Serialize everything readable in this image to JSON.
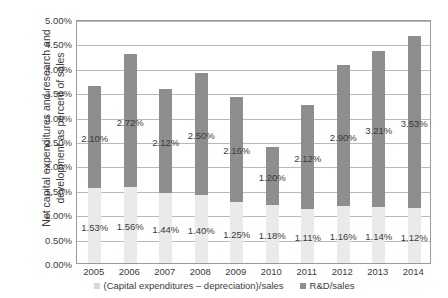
{
  "chart_data": {
    "type": "bar",
    "subtype": "stacked-bar",
    "title": "",
    "xlabel": "",
    "ylabel": "Net capital expenditures and research and development as percent of sales",
    "ylabel_line1": "Net capital expenditures and research and",
    "ylabel_line2": "development as percent of sales",
    "categories": [
      "2005",
      "2006",
      "2007",
      "2008",
      "2009",
      "2010",
      "2011",
      "2012",
      "2013",
      "2014"
    ],
    "ylim": [
      0,
      5
    ],
    "yticks": [
      "0.00%",
      "0.50%",
      "1.00%",
      "1.50%",
      "2.00%",
      "2.50%",
      "3.00%",
      "3.50%",
      "4.00%",
      "4.50%",
      "5.00%"
    ],
    "ytick_values": [
      0,
      0.5,
      1.0,
      1.5,
      2.0,
      2.5,
      3.0,
      3.5,
      4.0,
      4.5,
      5.0
    ],
    "grid": true,
    "legend_position": "bottom",
    "series": [
      {
        "name": "(Capital expenditures – depreciation)/sales",
        "color": "#eaeaea",
        "values": [
          1.53,
          1.56,
          1.44,
          1.4,
          1.25,
          1.18,
          1.11,
          1.16,
          1.14,
          1.12
        ],
        "labels": [
          "1.53%",
          "1.56%",
          "1.44%",
          "1.40%",
          "1.25%",
          "1.18%",
          "1.11%",
          "1.16%",
          "1.14%",
          "1.12%"
        ]
      },
      {
        "name": "R&D/sales",
        "color": "#8e8e8e",
        "values": [
          2.1,
          2.72,
          2.12,
          2.5,
          2.16,
          1.2,
          2.12,
          2.9,
          3.21,
          3.53
        ],
        "labels": [
          "2.10%",
          "2.72%",
          "2.12%",
          "2.50%",
          "2.16%",
          "1.20%",
          "2.12%",
          "2.90%",
          "3.21%",
          "3.53%"
        ]
      }
    ],
    "totals": [
      3.63,
      4.28,
      3.56,
      3.9,
      3.41,
      2.38,
      3.23,
      4.06,
      4.35,
      4.65
    ]
  },
  "legend": {
    "items": [
      {
        "label": "(Capital expenditures – depreciation)/sales",
        "color": "#d9d9d9"
      },
      {
        "label": "R&D/sales",
        "color": "#8e8e8e"
      }
    ]
  },
  "colors": {
    "capex_segment": "#eaeaea",
    "rnd_segment": "#8e8e8e",
    "gridline": "#b9b9b9",
    "axis_border": "#9a9a9a",
    "text": "#3b3b3b",
    "background": "#ffffff"
  }
}
